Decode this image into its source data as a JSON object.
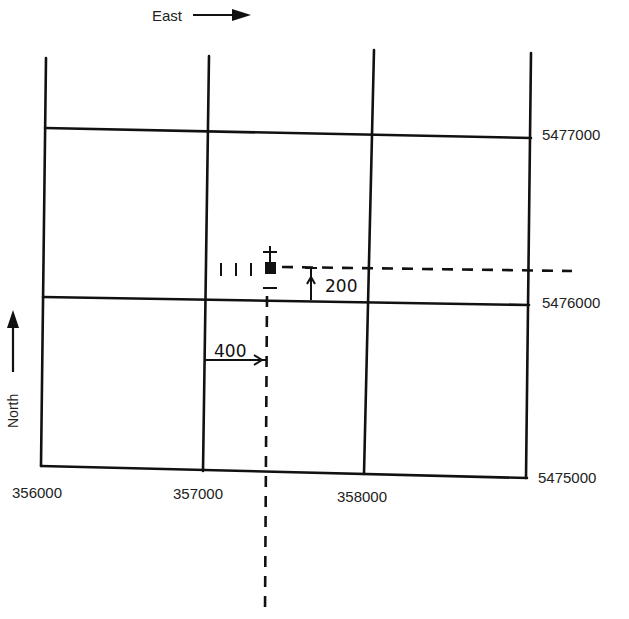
{
  "diagram": {
    "type": "grid-reference-map",
    "direction_labels": {
      "east": "East",
      "north": "North"
    },
    "easting_labels": [
      "356000",
      "357000",
      "358000"
    ],
    "northing_labels": [
      "5477000",
      "5476000",
      "5475000"
    ],
    "offsets": {
      "east_offset": "400",
      "north_offset": "200"
    },
    "point": {
      "easting": 357400,
      "northing": 5476200,
      "symbol": "filled-square-with-ticks"
    },
    "colors": {
      "ink": "#111111",
      "background": "#ffffff"
    }
  }
}
